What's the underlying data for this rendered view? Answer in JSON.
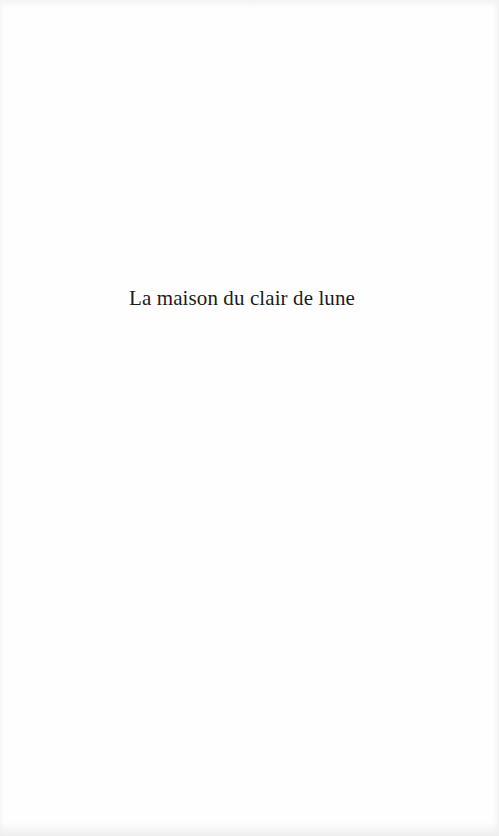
{
  "page": {
    "type": "half-title",
    "title": "La maison du clair de lune",
    "colors": {
      "background": "#fefefe",
      "text": "#1c1c1c"
    }
  }
}
